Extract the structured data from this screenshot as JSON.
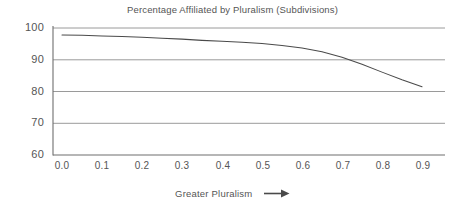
{
  "chart_data": {
    "type": "line",
    "title": "Percentage Affiliated by Pluralism (Subdivisions)",
    "xlabel": "Greater Pluralism",
    "ylabel": "",
    "xlim": [
      -0.05,
      0.96
    ],
    "ylim": [
      60,
      100
    ],
    "grid": true,
    "grid_axis": "y",
    "legend": false,
    "xticks": [
      "0.0",
      "0.1",
      "0.2",
      "0.3",
      "0.4",
      "0.5",
      "0.6",
      "0.7",
      "0.8",
      "0.9"
    ],
    "xtick_values": [
      0.0,
      0.1,
      0.2,
      0.3,
      0.4,
      0.5,
      0.6,
      0.7,
      0.8,
      0.9
    ],
    "yticks": [
      "60",
      "70",
      "80",
      "90",
      "100"
    ],
    "ytick_values": [
      60,
      70,
      80,
      90,
      100
    ],
    "series": [
      {
        "name": "Percentage Affiliated",
        "color": "#4a4a4a",
        "x": [
          0.0,
          0.05,
          0.1,
          0.15,
          0.2,
          0.25,
          0.3,
          0.35,
          0.4,
          0.45,
          0.5,
          0.55,
          0.6,
          0.65,
          0.7,
          0.75,
          0.8,
          0.85,
          0.9
        ],
        "values": [
          97.8,
          97.7,
          97.5,
          97.3,
          97.1,
          96.8,
          96.5,
          96.1,
          95.8,
          95.5,
          95.1,
          94.5,
          93.7,
          92.5,
          90.8,
          88.6,
          86.1,
          83.7,
          81.5
        ]
      }
    ],
    "annotations": [
      {
        "name": "x-axis-direction-arrow",
        "symbol": "arrow-right-icon",
        "text": "Greater Pluralism"
      }
    ]
  },
  "colors": {
    "line": "#4a4a4a",
    "grid": "#9a9a9a",
    "axis": "#6e6e6e",
    "text": "#555555",
    "background": "#ffffff"
  }
}
